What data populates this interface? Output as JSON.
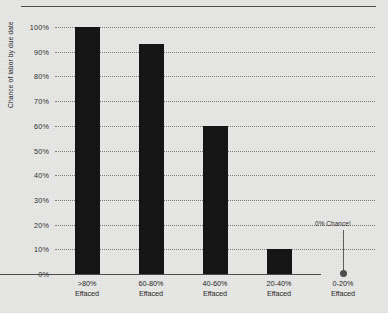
{
  "chart_data": {
    "type": "bar",
    "title": "",
    "xlabel": "",
    "ylabel": "Chance of labor by due date",
    "categories": [
      ">80%\nEffaced",
      "60-80%\nEffaced",
      "40-60%\nEffaced",
      "20-40%\nEffaced",
      "0-20%\nEffaced"
    ],
    "values": [
      100,
      93,
      60,
      10,
      0
    ],
    "ylim": [
      0,
      100
    ],
    "ytick_labels": [
      "100%",
      "90%",
      "80%",
      "70%",
      "60%",
      "50%",
      "40%",
      "30%",
      "20%",
      "10%",
      "0%"
    ],
    "ytick_values": [
      100,
      90,
      80,
      70,
      60,
      50,
      40,
      30,
      20,
      10,
      0
    ],
    "grid": true,
    "legend": "none",
    "bar_color": "#111111",
    "background_color": "#e9e9e7",
    "gridline_color": "#7b7b79",
    "annotations": [
      {
        "text": "0% Chance!",
        "category_index": 4,
        "value": 0
      }
    ]
  }
}
